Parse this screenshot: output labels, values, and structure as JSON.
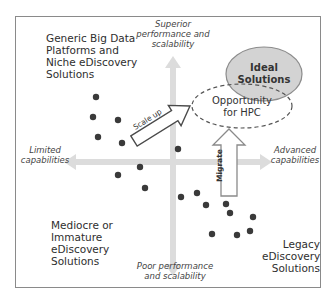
{
  "diagram": {
    "axes": {
      "top": "Superior performance and scalability",
      "top_lines": [
        "Superior",
        "performance and",
        "scalability"
      ],
      "bottom_lines": [
        "Poor performance",
        "and scalability"
      ],
      "left_lines": [
        "Limited",
        "capabilities"
      ],
      "right_lines": [
        "Advanced",
        "capabilities"
      ]
    },
    "quadrants": {
      "top_left": [
        "Generic Big Data",
        "Platforms and",
        "Niche eDiscovery",
        "Solutions"
      ],
      "bottom_left": [
        "Mediocre or",
        "Immature",
        "eDiscovery",
        "Solutions"
      ],
      "bottom_right": [
        "Legacy",
        "eDiscovery",
        "Solutions"
      ]
    },
    "regions": {
      "ideal": [
        "Ideal",
        "Solutions"
      ],
      "opportunity": [
        "Opportunity",
        "for HPC"
      ]
    },
    "arrows": {
      "scale_up": "Scale up",
      "migrate": "Migrate"
    },
    "colors": {
      "axis_arrow": "#d9d9d9",
      "ideal_fill": "#d0d0d0",
      "ideal_stroke": "#8c8c8c",
      "dashed": "#606060",
      "dot": "#3a3a3a",
      "frame": "#8a8a8a"
    },
    "dots": [
      [
        96,
        97
      ],
      [
        93,
        117
      ],
      [
        118,
        120
      ],
      [
        98,
        137
      ],
      [
        122,
        143
      ],
      [
        178,
        149
      ],
      [
        118,
        175
      ],
      [
        140,
        167
      ],
      [
        145,
        188
      ],
      [
        181,
        197
      ],
      [
        197,
        193
      ],
      [
        206,
        205
      ],
      [
        226,
        204
      ],
      [
        230,
        213
      ],
      [
        253,
        217
      ],
      [
        212,
        234
      ],
      [
        237,
        235
      ],
      [
        250,
        231
      ]
    ]
  }
}
